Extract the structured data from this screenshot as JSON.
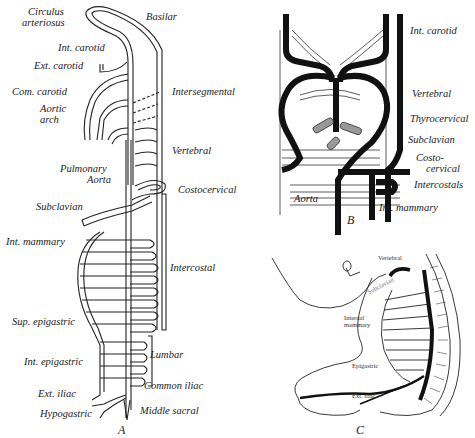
{
  "figure": {
    "panels": [
      {
        "id": "A",
        "letter": "A",
        "labels_left": [
          {
            "key": "circulus_1",
            "text": "Circulus"
          },
          {
            "key": "circulus_2",
            "text": "arteriosus"
          },
          {
            "key": "int_carotid",
            "text": "Int. carotid"
          },
          {
            "key": "ext_carotid",
            "text": "Ext. carotid"
          },
          {
            "key": "com_carotid",
            "text": "Com. carotid"
          },
          {
            "key": "aortic_1",
            "text": "Aortic"
          },
          {
            "key": "aortic_2",
            "text": "arch"
          },
          {
            "key": "pulmonary",
            "text": "Pulmonary"
          },
          {
            "key": "aorta",
            "text": "Aorta"
          },
          {
            "key": "subclavian",
            "text": "Subclavian"
          },
          {
            "key": "int_mammary",
            "text": "Int. mammary"
          },
          {
            "key": "sup_epigastric",
            "text": "Sup. epigastric"
          },
          {
            "key": "int_epigastric",
            "text": "Int. epigastric"
          },
          {
            "key": "ext_iliac",
            "text": "Ext. iliac"
          },
          {
            "key": "hypogastric",
            "text": "Hypogastric"
          }
        ],
        "labels_right": [
          {
            "key": "basilar",
            "text": "Basilar"
          },
          {
            "key": "intersegmental",
            "text": "Intersegmental"
          },
          {
            "key": "vertebral",
            "text": "Vertebral"
          },
          {
            "key": "costocervical",
            "text": "Costocervical"
          },
          {
            "key": "intercostal",
            "text": "Intercostal"
          },
          {
            "key": "lumbar",
            "text": "Lumbar"
          },
          {
            "key": "common_iliac",
            "text": "Common iliac"
          },
          {
            "key": "middle_sacral",
            "text": "Middle sacral"
          }
        ]
      },
      {
        "id": "B",
        "letter": "B",
        "labels": [
          {
            "key": "int_carotid",
            "text": "Int. carotid"
          },
          {
            "key": "vertebral",
            "text": "Vertebral"
          },
          {
            "key": "thyrocervical",
            "text": "Thyrocervical"
          },
          {
            "key": "subclavian",
            "text": "Subclavian"
          },
          {
            "key": "costo_1",
            "text": "Costo-"
          },
          {
            "key": "costo_2",
            "text": "cervical"
          },
          {
            "key": "intercostals",
            "text": "Intercostals"
          },
          {
            "key": "aorta",
            "text": "Aorta"
          },
          {
            "key": "int_mammary",
            "text": "Int. mammary"
          }
        ]
      },
      {
        "id": "C",
        "letter": "C",
        "labels": [
          {
            "key": "vertebral",
            "text": "Vertebral"
          },
          {
            "key": "subclavian",
            "text": "Subclavian"
          },
          {
            "key": "internal_1",
            "text": "Internal"
          },
          {
            "key": "internal_2",
            "text": "mammary"
          },
          {
            "key": "epigastric",
            "text": "Epigastric"
          },
          {
            "key": "ext_iliac",
            "text": "Ext. iliac"
          }
        ]
      }
    ]
  }
}
